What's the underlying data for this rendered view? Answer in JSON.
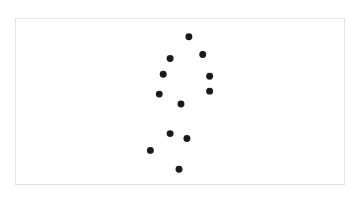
{
  "chart_data": {
    "type": "scatter",
    "title": "",
    "xlabel": "",
    "ylabel": "",
    "grid": false,
    "legend": null,
    "axes_visible": false,
    "coordinate_space": "frame-relative pixels (origin top-left of bordered frame, y downward)",
    "frame": {
      "width": 330,
      "height": 167
    },
    "marker": {
      "shape": "circle",
      "diameter": 7,
      "color": "#1a1a1a"
    },
    "series": [
      {
        "name": "points",
        "points": [
          {
            "x": 174,
            "y": 18
          },
          {
            "x": 155,
            "y": 40
          },
          {
            "x": 188,
            "y": 36
          },
          {
            "x": 148,
            "y": 56
          },
          {
            "x": 195,
            "y": 58
          },
          {
            "x": 144,
            "y": 76
          },
          {
            "x": 195,
            "y": 73
          },
          {
            "x": 166,
            "y": 86
          },
          {
            "x": 155,
            "y": 116
          },
          {
            "x": 172,
            "y": 121
          },
          {
            "x": 135,
            "y": 133
          },
          {
            "x": 164,
            "y": 152
          }
        ]
      }
    ]
  },
  "colors": {
    "background": "#ffffff",
    "frame_border": "#e4e4e4",
    "marker": "#1a1a1a"
  }
}
